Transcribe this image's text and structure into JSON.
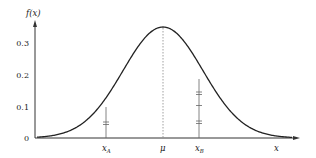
{
  "chart_data": {
    "type": "line",
    "title": "",
    "xlabel": "x",
    "ylabel": "f(x)",
    "ylim": [
      0,
      0.36
    ],
    "y_ticks": [
      "0",
      "0.1",
      "0.2",
      "0.3"
    ],
    "x_tick_labels": [
      "x_A",
      "μ",
      "x_B"
    ],
    "grid": false,
    "legend": null,
    "series": [
      {
        "name": "normal density f(x)",
        "description": "bell-shaped normal probability density curve peaking at μ",
        "peak_value": 0.345,
        "x": [
          -4,
          -3.5,
          -3,
          -2.5,
          -2,
          -1.5,
          -1,
          -0.5,
          0,
          0.5,
          1,
          1.5,
          2,
          2.5,
          3,
          3.5,
          4
        ],
        "values": [
          0.0002,
          0.001,
          0.0051,
          0.0204,
          0.0624,
          0.149,
          0.2779,
          0.4045,
          0.4584,
          0.4045,
          0.2779,
          0.149,
          0.0624,
          0.0204,
          0.0051,
          0.001,
          0.0002
        ]
      }
    ],
    "annotations": [
      {
        "type": "vertical-dashed-line",
        "at": "μ",
        "label": "μ",
        "height": 0.345
      },
      {
        "type": "vertical-line",
        "at": "x_A",
        "label": "x_A",
        "height": 0.1,
        "tick_marks": [
          "double"
        ]
      },
      {
        "type": "vertical-line",
        "at": "x_B",
        "label": "x_B",
        "height": 0.18,
        "tick_marks": [
          "double",
          "single",
          "double"
        ]
      }
    ]
  },
  "labels": {
    "y_axis": "f(x)",
    "x_axis": "x",
    "y_ticks": [
      "0",
      "0.1",
      "0.2",
      "0.3"
    ],
    "xa": "x",
    "xa_sub": "A",
    "mu": "μ",
    "xb": "x",
    "xb_sub": "B"
  },
  "colors": {
    "curve": "#222222",
    "axis": "#333333",
    "guide": "#666666",
    "mean_line": "#888888"
  }
}
